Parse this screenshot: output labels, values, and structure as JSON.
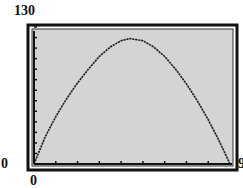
{
  "window": {
    "ymax": "130",
    "ymin": "0",
    "xmin": "0",
    "xmax": "9"
  },
  "colors": {
    "frame": "#111111",
    "plot_background": "#d4d4d4",
    "curve": "#1a1a1a",
    "label": "#111111"
  },
  "chart_data": {
    "type": "line",
    "title": "",
    "xlabel": "",
    "ylabel": "",
    "xlim": [
      0,
      9
    ],
    "ylim": [
      0,
      130
    ],
    "x_ticks_step": 1,
    "y_ticks_step": 10,
    "grid": false,
    "legend": null,
    "series": [
      {
        "name": "curve",
        "x": [
          0,
          0.5,
          1,
          1.5,
          2,
          2.5,
          3,
          3.5,
          4,
          4.4,
          5,
          5.5,
          6,
          6.5,
          7,
          7.5,
          8,
          8.5,
          9
        ],
        "y": [
          0,
          25,
          45,
          62,
          77,
          90,
          102,
          111,
          117,
          119,
          117,
          111,
          102,
          90,
          76,
          60,
          42,
          22,
          0
        ]
      }
    ],
    "tick_labels": {
      "y_top": "130",
      "y_bottom": "0",
      "x_left": "0",
      "x_right": "9"
    }
  }
}
